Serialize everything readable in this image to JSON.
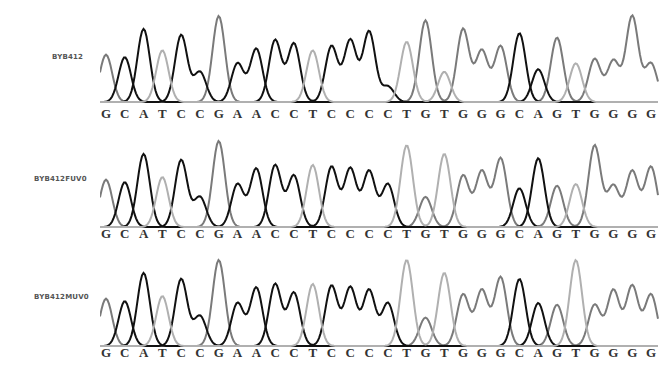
{
  "chart_data": {
    "type": "chromatogram",
    "title": "",
    "sequence": "GCATCCGAACCTCCCCTGTGGGCAGTGGGG",
    "bases": [
      "G",
      "C",
      "A",
      "T",
      "C",
      "C",
      "G",
      "A",
      "A",
      "C",
      "C",
      "T",
      "C",
      "C",
      "C",
      "C",
      "T",
      "G",
      "T",
      "G",
      "G",
      "G",
      "C",
      "A",
      "G",
      "T",
      "G",
      "G",
      "G",
      "G"
    ],
    "tracks": [
      {
        "label": "BYB412",
        "peak_heights": [
          0.55,
          0.52,
          0.85,
          0.6,
          0.78,
          0.35,
          1.0,
          0.45,
          0.62,
          0.72,
          0.68,
          0.6,
          0.65,
          0.72,
          0.82,
          0.18,
          0.7,
          0.95,
          0.35,
          0.85,
          0.6,
          0.65,
          0.8,
          0.38,
          0.75,
          0.45,
          0.5,
          0.48,
          1.0,
          0.45,
          0.65,
          0.68,
          0.48
        ]
      },
      {
        "label": "BYB412FUV0",
        "peak_heights": [
          0.55,
          0.52,
          0.85,
          0.58,
          0.78,
          0.35,
          1.0,
          0.5,
          0.68,
          0.72,
          0.6,
          0.72,
          0.7,
          0.68,
          0.65,
          0.5,
          0.95,
          0.35,
          0.85,
          0.6,
          0.65,
          0.8,
          0.45,
          0.8,
          0.48,
          0.5,
          0.95,
          0.48,
          0.65,
          0.7
        ]
      },
      {
        "label": "BYB412MUV0",
        "peak_heights": [
          0.55,
          0.52,
          0.85,
          0.58,
          0.78,
          0.35,
          1.0,
          0.5,
          0.68,
          0.72,
          0.62,
          0.72,
          0.7,
          0.68,
          0.65,
          0.5,
          1.0,
          0.33,
          0.85,
          0.6,
          0.65,
          0.8,
          0.78,
          0.5,
          0.48,
          1.0,
          0.48,
          0.65,
          0.7
        ]
      }
    ],
    "colors": {
      "A": "#111111",
      "C": "#111111",
      "G": "#7a7a7a",
      "T": "#b0b0b0"
    },
    "xlabel": "",
    "ylabel": ""
  },
  "tracks": [
    {
      "label": "BYB412"
    },
    {
      "label": "BYB412FUV0"
    },
    {
      "label": "BYB412MUV0"
    }
  ]
}
